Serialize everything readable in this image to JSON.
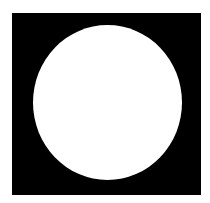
{
  "figure": {
    "colors": {
      "background": "#ffffff",
      "square": "#000000",
      "circle": "#ffffff"
    },
    "shapes": [
      {
        "type": "square",
        "x": 12,
        "y": 13,
        "width": 189,
        "height": 182
      },
      {
        "type": "circle",
        "cx": 107,
        "cy": 102,
        "rx": 74.5,
        "ry": 77.5
      }
    ]
  }
}
